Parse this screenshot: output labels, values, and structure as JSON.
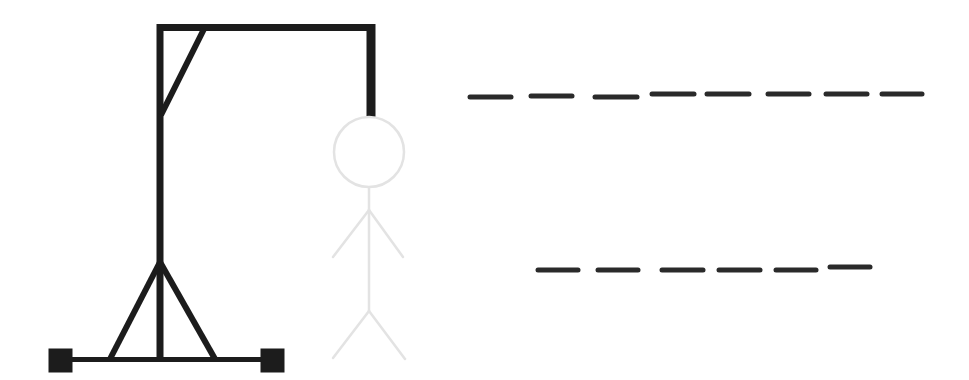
{
  "game": {
    "title": "Hangman",
    "colors": {
      "gallows": "#1c1c1c",
      "figure_hidden": "#e3e3e3",
      "blank": "#2a2a2a",
      "background": "#ffffff"
    },
    "figure_state": "all parts shown as faint placeholders (no wrong guesses)",
    "words": [
      {
        "row": 1,
        "length": 8,
        "letters": [
          "",
          "",
          "",
          "",
          "",
          "",
          "",
          ""
        ]
      },
      {
        "row": 2,
        "length": 6,
        "letters": [
          "",
          "",
          "",
          "",
          "",
          ""
        ]
      }
    ]
  }
}
